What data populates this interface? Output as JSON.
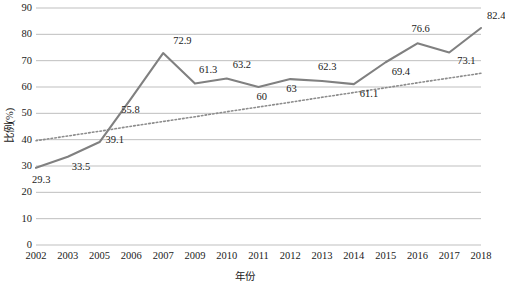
{
  "chart_data": {
    "type": "line",
    "title": "",
    "xlabel": "年份",
    "ylabel": "比例(%)",
    "categories": [
      "2002",
      "2003",
      "2005",
      "2006",
      "2007",
      "2009",
      "2010",
      "2011",
      "2012",
      "2013",
      "2014",
      "2015",
      "2016",
      "2017",
      "2018"
    ],
    "values": [
      29.3,
      33.5,
      39.1,
      55.8,
      72.9,
      61.3,
      63.2,
      60,
      63,
      62.3,
      61.1,
      69.4,
      76.6,
      73.1,
      82.4
    ],
    "point_labels": [
      "29.3",
      "33.5",
      "39.1",
      "55.8",
      "72.9",
      "61.3",
      "63.2",
      "60",
      "63",
      "62.3",
      "61.1",
      "69.4",
      "76.6",
      "73.1",
      "82.4"
    ],
    "ylim": [
      0,
      90
    ],
    "ytick_step": 10,
    "yticks": [
      "90",
      "80",
      "70",
      "60",
      "50",
      "40",
      "30",
      "20",
      "10",
      "0"
    ],
    "grid": true,
    "legend": "none",
    "series": [
      {
        "name": "比例(%)",
        "style": "solid",
        "color": "#808080",
        "values": [
          29.3,
          33.5,
          39.1,
          55.8,
          72.9,
          61.3,
          63.2,
          60,
          63,
          62.3,
          61.1,
          69.4,
          76.6,
          73.1,
          82.4
        ]
      },
      {
        "name": "趋势线",
        "style": "dotted",
        "color": "#8c8c8c",
        "values": [
          39.6,
          41.4,
          43.2,
          45.1,
          46.9,
          48.7,
          50.6,
          52.4,
          54.2,
          56.1,
          57.9,
          59.7,
          61.6,
          63.4,
          65.2
        ]
      }
    ],
    "trendline": {
      "type": "linear",
      "start_value": 39.6,
      "end_value": 65.2,
      "style": "dotted"
    },
    "axis_color": "#a6a6a6",
    "grid_color": "#bfbfbf",
    "note": "最后一个数据标签 82.4 在图像右边缘被裁切"
  }
}
